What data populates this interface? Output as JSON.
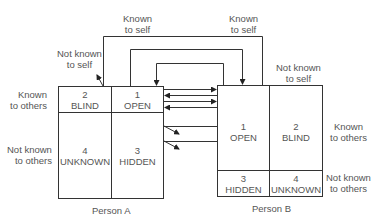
{
  "diagram": {
    "type": "johari-window-interaction",
    "axis_labels": {
      "known_to_self": "Known\nto self",
      "not_known_to_self": "Not known\nto self",
      "known_to_others": "Known\nto others",
      "not_known_to_others": "Not known\nto others"
    },
    "person_a": {
      "caption": "Person A",
      "quadrants": [
        {
          "number": "2",
          "name": "BLIND"
        },
        {
          "number": "1",
          "name": "OPEN"
        },
        {
          "number": "4",
          "name": "UNKNOWN"
        },
        {
          "number": "3",
          "name": "HIDDEN"
        }
      ]
    },
    "person_b": {
      "caption": "Person B",
      "quadrants": [
        {
          "number": "1",
          "name": "OPEN"
        },
        {
          "number": "2",
          "name": "BLIND"
        },
        {
          "number": "3",
          "name": "HIDDEN"
        },
        {
          "number": "4",
          "name": "UNKNOWN"
        }
      ]
    },
    "labels": {
      "a_known_to_self_l1": "Known",
      "a_known_to_self_l2": "to self",
      "a_not_known_to_self_l1": "Not known",
      "a_not_known_to_self_l2": "to self",
      "a_known_to_others_l1": "Known",
      "a_known_to_others_l2": "to others",
      "a_not_known_to_others_l1": "Not known",
      "a_not_known_to_others_l2": "to others",
      "b_known_to_self_l1": "Known",
      "b_known_to_self_l2": "to self",
      "b_not_known_to_self_l1": "Not known",
      "b_not_known_to_self_l2": "to self",
      "b_known_to_others_l1": "Known",
      "b_known_to_others_l2": "to others",
      "b_not_known_to_others_l1": "Not known",
      "b_not_known_to_others_l2": "to others"
    },
    "colors": {
      "line": "#333333",
      "text": "#555555",
      "background": "#ffffff"
    }
  }
}
